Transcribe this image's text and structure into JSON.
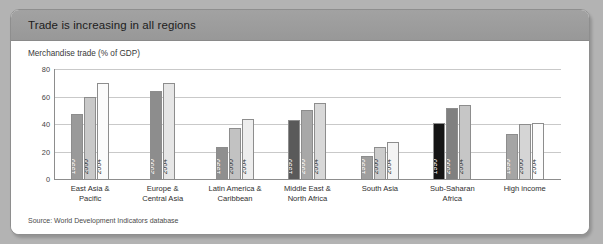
{
  "card": {
    "title": "Trade is increasing in all regions",
    "source": "Source: World Development Indicators database"
  },
  "chart_data": {
    "type": "bar",
    "title": "Trade is increasing in all regions",
    "subtitle": "Merchandise trade (% of GDP)",
    "ylabel": "Merchandise trade (% of GDP)",
    "xlabel": "",
    "ylim": [
      0,
      80
    ],
    "yticks": [
      0,
      20,
      40,
      60,
      80
    ],
    "grid": true,
    "legend": "in-bar year labels",
    "years": [
      "1990",
      "2000",
      "2004"
    ],
    "categories": [
      "East Asia &\nPacific",
      "Europe &\nCentral Asia",
      "Latin America &\nCaribbean",
      "Middle East &\nNorth Africa",
      "South Asia",
      "Sub-Saharan\nAfrica",
      "High income"
    ],
    "series": [
      {
        "name": "1990",
        "values": [
          47,
          null,
          23,
          43,
          17,
          41,
          33
        ]
      },
      {
        "name": "2000",
        "values": [
          60,
          64,
          37,
          50,
          23,
          52,
          40
        ]
      },
      {
        "name": "2004",
        "values": [
          70,
          70,
          44,
          55,
          27,
          54,
          41
        ]
      }
    ],
    "groups": [
      {
        "label_line1": "East Asia &",
        "label_line2": "Pacific",
        "bars": [
          {
            "year": "1990",
            "value": 47,
            "color": "#9a9a9a",
            "label_color": "#ffffff"
          },
          {
            "year": "2000",
            "value": 60,
            "color": "#c9c9c9",
            "label_color": "#333333"
          },
          {
            "year": "2004",
            "value": 70,
            "color": "#fbfbfb",
            "label_color": "#333333"
          }
        ]
      },
      {
        "label_line1": "Europe &",
        "label_line2": "Central Asia",
        "bars": [
          {
            "year": "2000",
            "value": 64,
            "color": "#8d8d8d",
            "label_color": "#ffffff"
          },
          {
            "year": "2004",
            "value": 70,
            "color": "#e6e6e6",
            "label_color": "#333333"
          }
        ]
      },
      {
        "label_line1": "Latin America &",
        "label_line2": "Caribbean",
        "bars": [
          {
            "year": "1990",
            "value": 23,
            "color": "#8f8f8f",
            "label_color": "#ffffff"
          },
          {
            "year": "2000",
            "value": 37,
            "color": "#c2c2c2",
            "label_color": "#333333"
          },
          {
            "year": "2004",
            "value": 44,
            "color": "#ededed",
            "label_color": "#333333"
          }
        ]
      },
      {
        "label_line1": "Middle East &",
        "label_line2": "North Africa",
        "bars": [
          {
            "year": "1990",
            "value": 43,
            "color": "#5a5a5a",
            "label_color": "#ffffff"
          },
          {
            "year": "2000",
            "value": 50,
            "color": "#a8a8a8",
            "label_color": "#ffffff"
          },
          {
            "year": "2004",
            "value": 55,
            "color": "#d8d8d8",
            "label_color": "#333333"
          }
        ]
      },
      {
        "label_line1": "South Asia",
        "label_line2": "",
        "bars": [
          {
            "year": "1990",
            "value": 17,
            "color": "#9e9e9e",
            "label_color": "#ffffff"
          },
          {
            "year": "2000",
            "value": 23,
            "color": "#cccccc",
            "label_color": "#333333"
          },
          {
            "year": "2004",
            "value": 27,
            "color": "#f4f4f4",
            "label_color": "#333333"
          }
        ]
      },
      {
        "label_line1": "Sub-Saharan",
        "label_line2": "Africa",
        "bars": [
          {
            "year": "1990",
            "value": 41,
            "color": "#151515",
            "label_color": "#ffffff"
          },
          {
            "year": "2000",
            "value": 52,
            "color": "#808080",
            "label_color": "#ffffff"
          },
          {
            "year": "2004",
            "value": 54,
            "color": "#c6c6c6",
            "label_color": "#333333"
          }
        ]
      },
      {
        "label_line1": "High income",
        "label_line2": "",
        "bars": [
          {
            "year": "1990",
            "value": 33,
            "color": "#a5a5a5",
            "label_color": "#ffffff"
          },
          {
            "year": "2000",
            "value": 40,
            "color": "#d5d5d5",
            "label_color": "#333333"
          },
          {
            "year": "2004",
            "value": 41,
            "color": "#fcfcfc",
            "label_color": "#333333"
          }
        ]
      }
    ]
  }
}
